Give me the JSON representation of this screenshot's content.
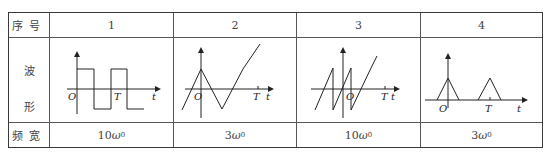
{
  "table": {
    "row_headers": {
      "index": "序号",
      "waveform_top": "波",
      "waveform_bottom": "形",
      "bandwidth": "频宽"
    },
    "columns": [
      {
        "index": "1",
        "waveform": "square-wave",
        "bandwidth_coef": "10",
        "bandwidth_sym": "ω",
        "bandwidth_sub": "0"
      },
      {
        "index": "2",
        "waveform": "triangle-wave",
        "bandwidth_coef": "3",
        "bandwidth_sym": "ω",
        "bandwidth_sub": "0"
      },
      {
        "index": "3",
        "waveform": "sawtooth-wave",
        "bandwidth_coef": "10",
        "bandwidth_sym": "ω",
        "bandwidth_sub": "0"
      },
      {
        "index": "4",
        "waveform": "triangular-pulse-train",
        "bandwidth_coef": "3",
        "bandwidth_sym": "ω",
        "bandwidth_sub": "0"
      }
    ],
    "axis_labels": {
      "origin": "O",
      "period": "T",
      "time": "t"
    }
  }
}
